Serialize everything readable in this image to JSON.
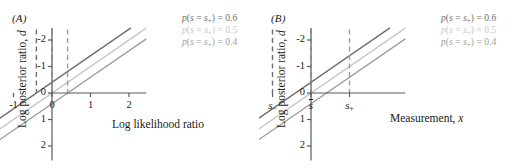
{
  "figure": {
    "background": "#ffffff",
    "panels": [
      {
        "id": "A",
        "label": "(A)",
        "xlabel": "Log likelihood ratio",
        "ylabel_main": "Log posterior ratio, ",
        "ylabel_sym": "d",
        "xticks": [
          "-1",
          "0",
          "1",
          "2"
        ],
        "xtick_values": [
          -1,
          0,
          1,
          2
        ],
        "yticks": [
          "2",
          "1",
          "0",
          "-1",
          "-2"
        ],
        "ytick_values": [
          2,
          1,
          0,
          -1,
          -2
        ],
        "xlim": [
          -2.0,
          2.45
        ],
        "ylim": [
          -2.55,
          2.45
        ],
        "vlines": [
          -0.405,
          0.0,
          0.405
        ],
        "legend": [
          {
            "text": "p(s = s+) = 0.6",
            "value": 0.6,
            "prefix": "p(s = s",
            "sub": "+",
            "suffix": ") = 0.6",
            "color": "#6e6e6e"
          },
          {
            "text": "p(s = s+) = 0.5",
            "value": 0.5,
            "prefix": "p(s = s",
            "sub": "+",
            "suffix": ") = 0.5",
            "color": "#c8c8c8"
          },
          {
            "text": "p(s = s+) = 0.4",
            "value": 0.4,
            "prefix": "p(s = s",
            "sub": "+",
            "suffix": ") = 0.4",
            "color": "#9e9e9e"
          }
        ]
      },
      {
        "id": "B",
        "label": "(B)",
        "xlabel_main": "Measurement, ",
        "xlabel_sym": "x",
        "ylabel_main": "Log posterior ratio, ",
        "ylabel_sym": "d",
        "xticks": [
          "s-",
          "s̄",
          "s+"
        ],
        "xtick_values": [
          -1,
          0,
          1
        ],
        "yticks": [
          "2",
          "1",
          "0",
          "-1",
          "-2"
        ],
        "ytick_values": [
          2,
          1,
          0,
          -1,
          -2
        ],
        "xlim": [
          -2.0,
          2.45
        ],
        "ylim": [
          -2.55,
          2.45
        ],
        "vlines": [
          -1.0,
          0.0,
          1.0
        ],
        "legend": [
          {
            "text": "p(s = s+) = 0.6",
            "value": 0.6,
            "prefix": "p(s = s",
            "sub": "+",
            "suffix": ") = 0.6",
            "color": "#6e6e6e"
          },
          {
            "text": "p(s = s+) = 0.5",
            "value": 0.5,
            "prefix": "p(s = s",
            "sub": "+",
            "suffix": ") = 0.5",
            "color": "#c8c8c8"
          },
          {
            "text": "p(s = s+) = 0.4",
            "value": 0.4,
            "prefix": "p(s = s",
            "sub": "+",
            "suffix": ") = 0.4",
            "color": "#9e9e9e"
          }
        ]
      }
    ]
  },
  "chart_data": {
    "type": "line",
    "title": "",
    "panels": [
      {
        "name": "(A)",
        "xlabel": "Log likelihood ratio",
        "ylabel": "Log posterior ratio, d",
        "xlim": [
          -2.0,
          2.45
        ],
        "ylim": [
          -2.55,
          2.45
        ],
        "xticks": [
          -1,
          0,
          1,
          2
        ],
        "yticks": [
          -2,
          -1,
          0,
          1,
          2
        ],
        "grid": false,
        "legend_position": "top-right",
        "vertical_dashed_lines": [
          -0.405,
          0.0,
          0.405
        ],
        "series": [
          {
            "name": "p(s = s+) = 0.6",
            "prior": 0.6,
            "slope": 1,
            "intercept": 0.405,
            "color": "#6e6e6e",
            "x": [
              -2.0,
              2.05
            ],
            "y": [
              -1.595,
              2.455
            ]
          },
          {
            "name": "p(s = s+) = 0.5",
            "prior": 0.5,
            "slope": 1,
            "intercept": 0.0,
            "color": "#c8c8c8",
            "x": [
              -2.0,
              2.45
            ],
            "y": [
              -2.0,
              2.45
            ]
          },
          {
            "name": "p(s = s+) = 0.4",
            "prior": 0.4,
            "slope": 1,
            "intercept": -0.405,
            "color": "#9e9e9e",
            "x": [
              -2.0,
              2.45
            ],
            "y": [
              -2.405,
              2.045
            ]
          }
        ]
      },
      {
        "name": "(B)",
        "xlabel": "Measurement, x",
        "ylabel": "Log posterior ratio, d",
        "xlim": [
          -2.0,
          2.45
        ],
        "ylim": [
          -2.55,
          2.45
        ],
        "xticks": [
          -1,
          0,
          1
        ],
        "xticklabels": [
          "s-",
          "s̄",
          "s+"
        ],
        "yticks": [
          -2,
          -1,
          0,
          1,
          2
        ],
        "grid": false,
        "legend_position": "top-right",
        "vertical_dashed_lines": [
          -1.0,
          0.0,
          1.0
        ],
        "series": [
          {
            "name": "p(s = s+) = 0.6",
            "prior": 0.6,
            "slope": 1,
            "intercept": 0.405,
            "color": "#6e6e6e",
            "x": [
              -2.0,
              2.05
            ],
            "y": [
              -1.595,
              2.455
            ]
          },
          {
            "name": "p(s = s+) = 0.5",
            "prior": 0.5,
            "slope": 1,
            "intercept": 0.0,
            "color": "#c8c8c8",
            "x": [
              -2.0,
              2.45
            ],
            "y": [
              -2.0,
              2.45
            ]
          },
          {
            "name": "p(s = s+) = 0.4",
            "prior": 0.4,
            "slope": 1,
            "intercept": -0.405,
            "color": "#9e9e9e",
            "x": [
              -2.0,
              2.45
            ],
            "y": [
              -2.405,
              2.045
            ]
          }
        ]
      }
    ]
  }
}
